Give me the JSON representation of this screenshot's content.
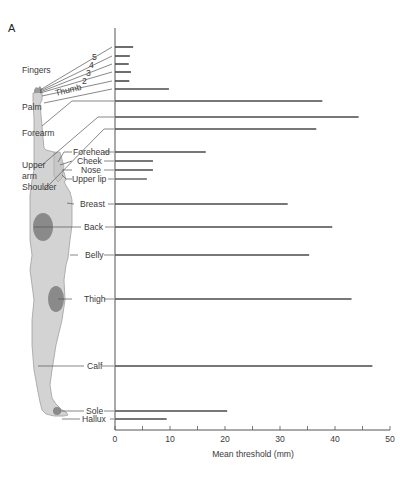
{
  "panel_label": "A",
  "chart_data": {
    "type": "bar",
    "orientation": "horizontal",
    "title": "",
    "xlabel": "Mean threshold (mm)",
    "ylabel": "",
    "xlim": [
      0,
      50
    ],
    "xticks": [
      0,
      10,
      20,
      30,
      40,
      50
    ],
    "minor_ticks_every": 5,
    "grid": false,
    "legend": null,
    "group_labels": [
      "Fingers",
      "Upper arm"
    ],
    "categories": [
      "5",
      "4",
      "3",
      "2",
      "Thumb",
      "Palm",
      "Forearm",
      "Upper arm",
      "Shoulder",
      "Forehead",
      "Cheek",
      "Nose",
      "Upper lip",
      "Breast",
      "Back",
      "Belly",
      "Thigh",
      "Calf",
      "Sole",
      "Hallux"
    ],
    "values": [
      3.3,
      2.7,
      2.5,
      2.9,
      2.6,
      9.8,
      37.7,
      44.3,
      36.6,
      16.5,
      6.9,
      6.9,
      5.8,
      31.4,
      39.5,
      35.3,
      43.0,
      46.8,
      20.4,
      9.4
    ]
  },
  "axis": {
    "tick_labels": [
      "0",
      "10",
      "20",
      "30",
      "40",
      "50"
    ],
    "x_label": "Mean threshold (mm)"
  },
  "labels": {
    "fingers": "Fingers",
    "f5": "5",
    "f4": "4",
    "f3": "3",
    "f2": "2",
    "thumb": "Thumb",
    "palm": "Palm",
    "forearm": "Forearm",
    "upper_arm_1": "Upper",
    "upper_arm_2": "arm",
    "shoulder": "Shoulder",
    "forehead": "Forehead",
    "cheek": "Cheek",
    "nose": "Nose",
    "upper_lip": "Upper lip",
    "breast": "Breast",
    "back": "Back",
    "belly": "Belly",
    "thigh": "Thigh",
    "calf": "Calf",
    "sole": "Sole",
    "hallux": "Hallux"
  },
  "colors": {
    "bar": "#4a4a4a",
    "axis": "#555555",
    "body_fill": "#d3d3d3",
    "body_stroke": "#9a9a9a",
    "patch": "#8a8a8a"
  }
}
